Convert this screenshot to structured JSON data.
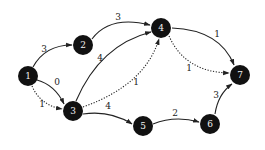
{
  "diagram": {
    "type": "directed-weighted-graph",
    "nodes": [
      {
        "id": "1",
        "label": "1",
        "x": 28,
        "y": 76
      },
      {
        "id": "2",
        "label": "2",
        "x": 83,
        "y": 45
      },
      {
        "id": "3",
        "label": "3",
        "x": 73,
        "y": 111
      },
      {
        "id": "4",
        "label": "4",
        "x": 161,
        "y": 28
      },
      {
        "id": "5",
        "label": "5",
        "x": 143,
        "y": 126
      },
      {
        "id": "6",
        "label": "6",
        "x": 210,
        "y": 124
      },
      {
        "id": "7",
        "label": "7",
        "x": 240,
        "y": 75
      }
    ],
    "edges": [
      {
        "from": "1",
        "to": "2",
        "weight": "3",
        "style": "solid"
      },
      {
        "from": "1",
        "to": "3",
        "weight": "0",
        "style": "solid"
      },
      {
        "from": "1",
        "to": "3",
        "weight": "1",
        "style": "dotted"
      },
      {
        "from": "2",
        "to": "4",
        "weight": "3",
        "style": "solid"
      },
      {
        "from": "3",
        "to": "4",
        "weight": "4",
        "style": "solid"
      },
      {
        "from": "3",
        "to": "4",
        "weight": "1",
        "style": "dotted"
      },
      {
        "from": "3",
        "to": "5",
        "weight": "4",
        "style": "solid"
      },
      {
        "from": "4",
        "to": "7",
        "weight": "1",
        "style": "solid"
      },
      {
        "from": "4",
        "to": "7",
        "weight": "1",
        "style": "dotted"
      },
      {
        "from": "5",
        "to": "6",
        "weight": "2",
        "style": "solid"
      },
      {
        "from": "6",
        "to": "7",
        "weight": "3",
        "style": "solid"
      }
    ]
  },
  "labels": {
    "n1": "1",
    "n2": "2",
    "n3": "3",
    "n4": "4",
    "n5": "5",
    "n6": "6",
    "n7": "7",
    "e12": "3",
    "e13_solid": "0",
    "e13_dotted": "1",
    "e24": "3",
    "e34_solid": "4",
    "e34_dotted": "1",
    "e35": "4",
    "e47_solid": "1",
    "e47_dotted": "1",
    "e56": "2",
    "e67": "3"
  },
  "colors": {
    "node_fill": "#111111",
    "node_text": "#f2f2f2",
    "edge": "#222222",
    "background": "#ffffff"
  }
}
